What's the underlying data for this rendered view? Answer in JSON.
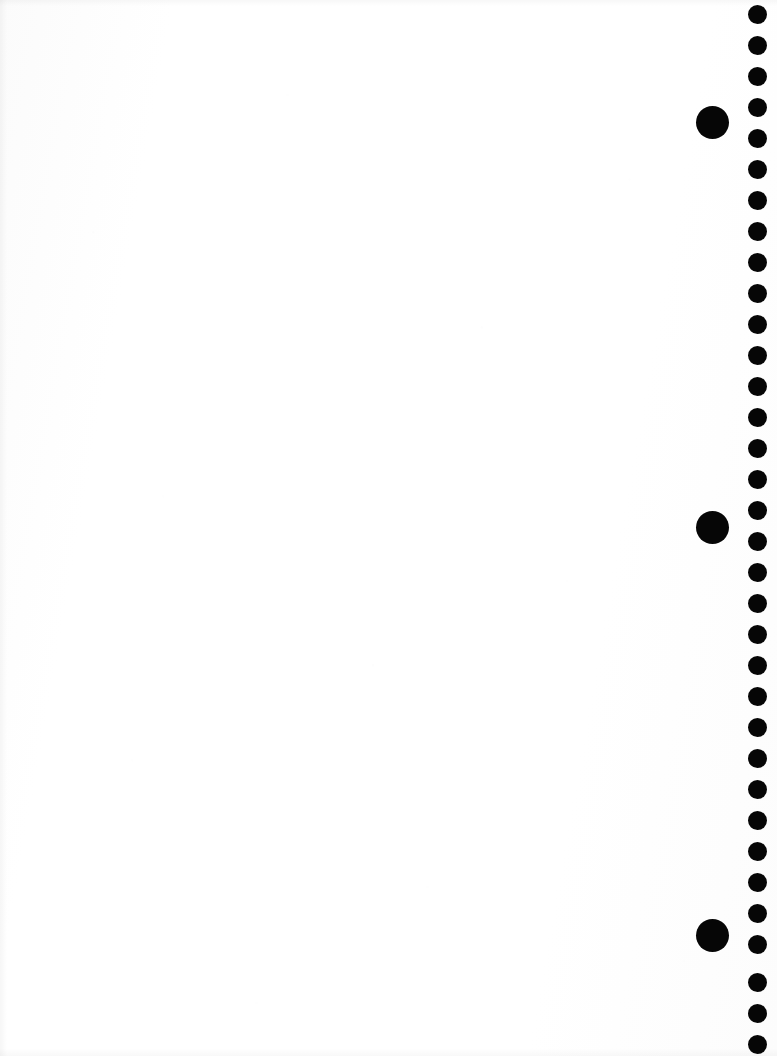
{
  "page": {
    "kind": "scanned-blank-page",
    "width": 777,
    "height": 1056,
    "background_color": "#ffffff",
    "mark_color": "#060606",
    "content_text": ""
  },
  "content_area": {
    "label": "",
    "text": ""
  },
  "dot_rail": {
    "label": "",
    "small_dot_count": 34,
    "small_dot_diameter": 19,
    "small_dot_center_x": 757,
    "small_dot_spacing": 31,
    "small_dot_first_center_y": 14,
    "large_dot_count": 3,
    "large_dot_diameter": 33,
    "large_dot_center_x": 712,
    "small_dots": [
      {
        "cx": 757,
        "cy": 14
      },
      {
        "cx": 757,
        "cy": 45
      },
      {
        "cx": 757,
        "cy": 76
      },
      {
        "cx": 757,
        "cy": 107
      },
      {
        "cx": 757,
        "cy": 138
      },
      {
        "cx": 757,
        "cy": 169
      },
      {
        "cx": 757,
        "cy": 200
      },
      {
        "cx": 757,
        "cy": 231
      },
      {
        "cx": 757,
        "cy": 262
      },
      {
        "cx": 757,
        "cy": 293
      },
      {
        "cx": 757,
        "cy": 324
      },
      {
        "cx": 757,
        "cy": 355
      },
      {
        "cx": 757,
        "cy": 386
      },
      {
        "cx": 757,
        "cy": 417
      },
      {
        "cx": 757,
        "cy": 448
      },
      {
        "cx": 757,
        "cy": 479
      },
      {
        "cx": 757,
        "cy": 510
      },
      {
        "cx": 757,
        "cy": 541
      },
      {
        "cx": 757,
        "cy": 572
      },
      {
        "cx": 757,
        "cy": 603
      },
      {
        "cx": 757,
        "cy": 634
      },
      {
        "cx": 757,
        "cy": 665
      },
      {
        "cx": 757,
        "cy": 696
      },
      {
        "cx": 757,
        "cy": 727
      },
      {
        "cx": 757,
        "cy": 758
      },
      {
        "cx": 757,
        "cy": 789
      },
      {
        "cx": 757,
        "cy": 820
      },
      {
        "cx": 757,
        "cy": 851
      },
      {
        "cx": 757,
        "cy": 882
      },
      {
        "cx": 757,
        "cy": 913
      },
      {
        "cx": 757,
        "cy": 944
      },
      {
        "cx": 757,
        "cy": 982
      },
      {
        "cx": 757,
        "cy": 1013
      },
      {
        "cx": 757,
        "cy": 1044
      }
    ],
    "large_dots": [
      {
        "cx": 712,
        "cy": 122
      },
      {
        "cx": 712,
        "cy": 527
      },
      {
        "cx": 712,
        "cy": 935
      }
    ]
  }
}
